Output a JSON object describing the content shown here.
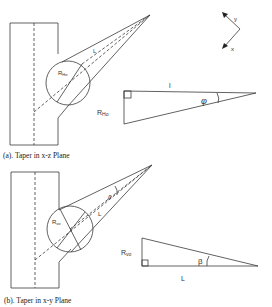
{
  "figure": {
    "top_header_partial": "…                            p (Figure )",
    "axes": {
      "y_label": "y",
      "x_label": "x"
    },
    "panel_a": {
      "caption": "(a). Taper in x-z Plane",
      "circle_label_main": "R",
      "circle_label_sub": "Ho",
      "cone_label": "L",
      "triangle": {
        "top_label": "l",
        "side_label_main": "R",
        "side_label_sub": "Ho",
        "angle_label": "φ"
      }
    },
    "panel_b": {
      "caption": "(b). Taper in x-y Plane",
      "circle_label_main": "R",
      "circle_label_sub": "vo",
      "cone_label": "L",
      "cone_angle_label": "β",
      "triangle": {
        "bottom_label": "L",
        "side_label_main": "R",
        "side_label_sub": "vo",
        "angle_label": "β"
      }
    }
  }
}
